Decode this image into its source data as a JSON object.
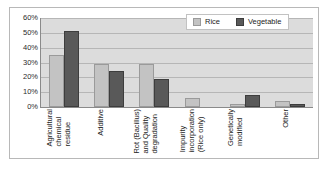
{
  "chart_data": {
    "type": "bar",
    "title": "",
    "xlabel": "",
    "ylabel": "",
    "ylim": [
      0,
      60
    ],
    "grid": true,
    "legend_position": "top-right",
    "tick_labels": [
      "60%",
      "50%",
      "40%",
      "30%",
      "20%",
      "10%",
      "0%"
    ],
    "categories": [
      "Agricultural chemical residue",
      "Additive",
      "Rot (Bacillus) and Quality degradation",
      "Impurity incorporation (Rice only)",
      "Genetically modified",
      "Other"
    ],
    "category_lines": [
      [
        "Agricultural",
        "chemical",
        "residue"
      ],
      [
        "Additive"
      ],
      [
        "Rot (Bacillus)",
        "and Quality",
        "degradation"
      ],
      [
        "Impurity",
        "incorporation",
        "(Rice only)"
      ],
      [
        "Genetically",
        "modified"
      ],
      [
        "Other"
      ]
    ],
    "series": [
      {
        "name": "Rice",
        "color": "#c3c3c3",
        "values": [
          35,
          29,
          29,
          6,
          2,
          4
        ]
      },
      {
        "name": "Vegetable",
        "color": "#595959",
        "values": [
          51,
          24,
          19,
          0,
          8,
          2
        ]
      }
    ]
  },
  "legend": {
    "entries": [
      {
        "label": "Rice"
      },
      {
        "label": "Vegetable"
      }
    ]
  }
}
